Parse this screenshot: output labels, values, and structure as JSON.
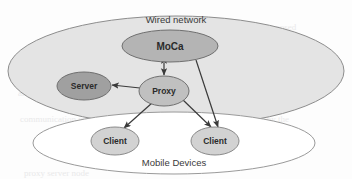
{
  "diagram": {
    "background_color": "#fdfdfd",
    "groups": [
      {
        "id": "wired-network",
        "label": "Wired network",
        "shape": "ellipse",
        "cx": 176,
        "cy": 71,
        "rx": 168,
        "ry": 55,
        "fill": "#e4e4e4",
        "stroke": "#8d8d8d",
        "label_x": 176,
        "label_y": 20,
        "font_size": 9.5
      },
      {
        "id": "mobile-devices",
        "label": "Mobile Devices",
        "shape": "ellipse",
        "cx": 174,
        "cy": 143,
        "rx": 141,
        "ry": 31,
        "fill": "#ffffff",
        "stroke": "#9a9a9a",
        "label_x": 174,
        "label_y": 163,
        "font_size": 9.5
      }
    ],
    "nodes": [
      {
        "id": "moca",
        "label": "MoCa",
        "cx": 170,
        "cy": 46,
        "rx": 48,
        "ry": 16,
        "fill": "#b4b4b4",
        "stroke": "#6f6f6f",
        "font_size": 10
      },
      {
        "id": "server",
        "label": "Server",
        "cx": 84,
        "cy": 86,
        "rx": 27,
        "ry": 14,
        "fill": "#a0a0a0",
        "stroke": "#6f6f6f",
        "font_size": 8.5
      },
      {
        "id": "proxy",
        "label": "Proxy",
        "cx": 164,
        "cy": 91,
        "rx": 25,
        "ry": 15,
        "fill": "#c0c0c0",
        "stroke": "#6f6f6f",
        "font_size": 8.5
      },
      {
        "id": "client-left",
        "label": "Client",
        "cx": 115,
        "cy": 141,
        "rx": 24,
        "ry": 14,
        "fill": "#d2d2d2",
        "stroke": "#8a8a8a",
        "font_size": 8.5
      },
      {
        "id": "client-right",
        "label": "Client",
        "cx": 215,
        "cy": 141,
        "rx": 24,
        "ry": 14,
        "fill": "#d2d2d2",
        "stroke": "#8a8a8a",
        "font_size": 8.5
      }
    ],
    "edges": [
      {
        "id": "moca-proxy",
        "from": "moca",
        "to": "proxy",
        "x1": 164,
        "y1": 62,
        "x2": 164,
        "y2": 76,
        "arrow": "both",
        "stroke": "#3a3a3a"
      },
      {
        "id": "proxy-server",
        "from": "proxy",
        "to": "server",
        "x1": 140,
        "y1": 88,
        "x2": 112,
        "y2": 85,
        "arrow": "end",
        "stroke": "#3a3a3a"
      },
      {
        "id": "proxy-client-left",
        "from": "proxy",
        "to": "client-left",
        "x1": 152,
        "y1": 103,
        "x2": 124,
        "y2": 128,
        "arrow": "end",
        "stroke": "#3a3a3a"
      },
      {
        "id": "proxy-client-right",
        "from": "proxy",
        "to": "client-right",
        "x1": 182,
        "y1": 99,
        "x2": 211,
        "y2": 127,
        "arrow": "end",
        "stroke": "#3a3a3a"
      },
      {
        "id": "moca-client-right",
        "from": "moca",
        "to": "client-right",
        "x1": 196,
        "y1": 60,
        "x2": 218,
        "y2": 127,
        "arrow": "end",
        "stroke": "#3a3a3a"
      }
    ]
  }
}
